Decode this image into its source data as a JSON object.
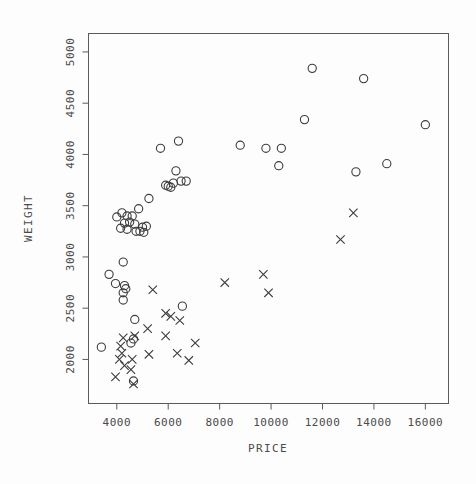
{
  "chart_data": {
    "type": "scatter",
    "title": "",
    "xlabel": "PRICE",
    "ylabel": "WEIGHT",
    "xlim": [
      2900,
      16900
    ],
    "ylim": [
      1570,
      5180
    ],
    "xticks": [
      4000,
      6000,
      8000,
      10000,
      12000,
      14000,
      16000
    ],
    "yticks": [
      2000,
      2500,
      3000,
      3500,
      4000,
      4500,
      5000
    ],
    "xticklabels": [
      "4000",
      "6000",
      "8000",
      "10000",
      "12000",
      "14000",
      "16000"
    ],
    "yticklabels": [
      "2000",
      "2500",
      "3000",
      "3500",
      "4000",
      "4500",
      "5000"
    ],
    "grid": false,
    "legend": "none",
    "marker_colors": {
      "circle": "#3c3c3c",
      "cross": "#3c3c3c",
      "frame": "#5a5a5a",
      "background": "#fdfdfd"
    },
    "series": [
      {
        "name": "circle-series",
        "marker": "circle",
        "points": [
          [
            11600,
            4840
          ],
          [
            13600,
            4740
          ],
          [
            11300,
            4340
          ],
          [
            16000,
            4290
          ],
          [
            8800,
            4090
          ],
          [
            5700,
            4060
          ],
          [
            6400,
            4130
          ],
          [
            9800,
            4060
          ],
          [
            10400,
            4060
          ],
          [
            10300,
            3890
          ],
          [
            13300,
            3830
          ],
          [
            14500,
            3910
          ],
          [
            6300,
            3840
          ],
          [
            6500,
            3740
          ],
          [
            6200,
            3720
          ],
          [
            6700,
            3740
          ],
          [
            5900,
            3700
          ],
          [
            6000,
            3690
          ],
          [
            6100,
            3680
          ],
          [
            5250,
            3570
          ],
          [
            4850,
            3470
          ],
          [
            4200,
            3430
          ],
          [
            4400,
            3400
          ],
          [
            4600,
            3400
          ],
          [
            4000,
            3390
          ],
          [
            4300,
            3330
          ],
          [
            4500,
            3340
          ],
          [
            4700,
            3320
          ],
          [
            5000,
            3290
          ],
          [
            5150,
            3300
          ],
          [
            4150,
            3280
          ],
          [
            4400,
            3270
          ],
          [
            4750,
            3250
          ],
          [
            4900,
            3250
          ],
          [
            5050,
            3240
          ],
          [
            4250,
            2950
          ],
          [
            3700,
            2830
          ],
          [
            3950,
            2740
          ],
          [
            4300,
            2720
          ],
          [
            4350,
            2690
          ],
          [
            4250,
            2650
          ],
          [
            4250,
            2580
          ],
          [
            6550,
            2520
          ],
          [
            4700,
            2390
          ],
          [
            4650,
            2200
          ],
          [
            4550,
            2160
          ],
          [
            3400,
            2120
          ],
          [
            4650,
            1790
          ]
        ]
      },
      {
        "name": "cross-series",
        "marker": "x",
        "points": [
          [
            13200,
            3430
          ],
          [
            12700,
            3170
          ],
          [
            9700,
            2830
          ],
          [
            8200,
            2750
          ],
          [
            9900,
            2650
          ],
          [
            5400,
            2680
          ],
          [
            5900,
            2450
          ],
          [
            6100,
            2420
          ],
          [
            6450,
            2380
          ],
          [
            5200,
            2300
          ],
          [
            5900,
            2230
          ],
          [
            4700,
            2230
          ],
          [
            4250,
            2210
          ],
          [
            4150,
            2130
          ],
          [
            7050,
            2160
          ],
          [
            4200,
            2060
          ],
          [
            5250,
            2050
          ],
          [
            6350,
            2060
          ],
          [
            4100,
            2000
          ],
          [
            4600,
            2000
          ],
          [
            6800,
            1990
          ],
          [
            4300,
            1940
          ],
          [
            4550,
            1900
          ],
          [
            3950,
            1830
          ],
          [
            4650,
            1760
          ]
        ]
      }
    ]
  },
  "axes": {
    "x_title": "PRICE",
    "y_title": "WEIGHT"
  }
}
